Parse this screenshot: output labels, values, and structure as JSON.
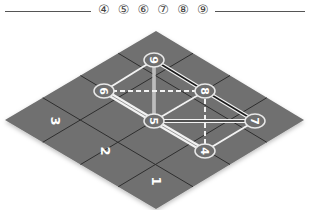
{
  "header": {
    "title_glyphs": "④ ⑤ ⑥ ⑦ ⑧ ⑨"
  },
  "board": {
    "colors": {
      "tile": "#6f6f6f",
      "grid_line": "#2e2e2e",
      "node_stroke": "#e8e8e8",
      "edge": "#f2f2f2",
      "dark_edge": "#1a1a1a"
    },
    "cell_labels": [
      {
        "text": "3",
        "x": 55,
        "y": 121
      },
      {
        "text": "2",
        "x": 105,
        "y": 151
      },
      {
        "text": "1",
        "x": 156,
        "y": 181
      }
    ],
    "nodes": [
      {
        "id": "9",
        "x": 154,
        "y": 60
      },
      {
        "id": "6",
        "x": 104,
        "y": 91
      },
      {
        "id": "8",
        "x": 205,
        "y": 91
      },
      {
        "id": "5",
        "x": 154,
        "y": 121
      },
      {
        "id": "7",
        "x": 255,
        "y": 121
      },
      {
        "id": "4",
        "x": 205,
        "y": 151
      }
    ]
  }
}
